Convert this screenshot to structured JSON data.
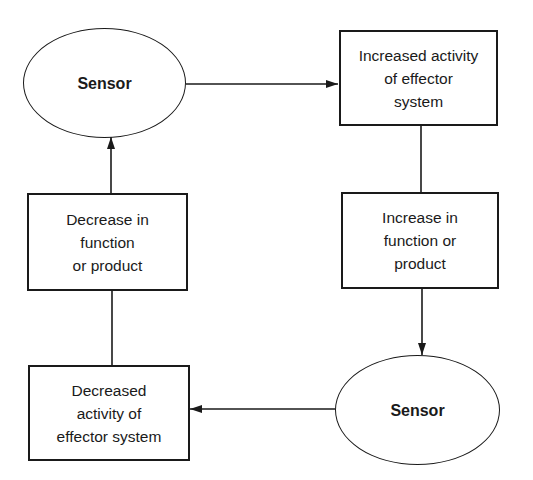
{
  "diagram": {
    "type": "feedback-loop flowchart",
    "nodes": [
      {
        "id": "sensor_top",
        "shape": "ellipse",
        "label": "Sensor"
      },
      {
        "id": "increased_activity",
        "shape": "box",
        "label": "Increased activity\nof effector\nsystem"
      },
      {
        "id": "increase_function",
        "shape": "box",
        "label": "Increase in\nfunction or\nproduct"
      },
      {
        "id": "sensor_bottom",
        "shape": "ellipse",
        "label": "Sensor"
      },
      {
        "id": "decreased_activity",
        "shape": "box",
        "label": "Decreased\nactivity of\neffector system"
      },
      {
        "id": "decrease_function",
        "shape": "box",
        "label": "Decrease in\nfunction\nor product"
      }
    ],
    "edges": [
      {
        "from": "sensor_top",
        "to": "increased_activity",
        "arrow": true
      },
      {
        "from": "increased_activity",
        "to": "increase_function",
        "arrow": false
      },
      {
        "from": "increase_function",
        "to": "sensor_bottom",
        "arrow": true
      },
      {
        "from": "sensor_bottom",
        "to": "decreased_activity",
        "arrow": true
      },
      {
        "from": "decreased_activity",
        "to": "decrease_function",
        "arrow": false
      },
      {
        "from": "decrease_function",
        "to": "sensor_top",
        "arrow": true
      }
    ],
    "colors": {
      "stroke": "#1a1a1a",
      "background": "#ffffff"
    }
  }
}
